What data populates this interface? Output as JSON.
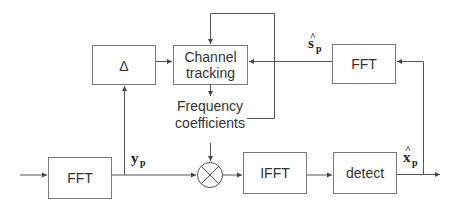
{
  "diagram": {
    "blocks": {
      "delta": "Δ",
      "channel_tracking_line1": "Channel",
      "channel_tracking_line2": "tracking",
      "fft_feedback": "FFT",
      "fft_input": "FFT",
      "ifft": "IFFT",
      "detect": "detect"
    },
    "labels": {
      "freq_coeff_line1": "Frequency",
      "freq_coeff_line2": "coefficients",
      "y_p": {
        "base": "y",
        "sub": "p"
      },
      "s_hat_p": {
        "base": "s",
        "hat": "^",
        "sub": "p"
      },
      "x_hat_p": {
        "base": "x",
        "hat": "^",
        "sub": "p"
      }
    },
    "multiplier_symbol": "⊗",
    "colors": {
      "stroke": "#555555",
      "box_stroke": "#7a7a7a",
      "text": "#333333"
    }
  }
}
